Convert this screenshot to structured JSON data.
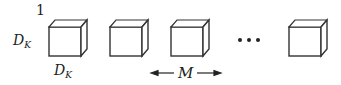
{
  "diagram": {
    "index_label": "1",
    "height_label": {
      "base": "D",
      "sub": "K"
    },
    "width_label": {
      "base": "D",
      "sub": "K"
    },
    "spacing_label": "M",
    "ellipsis": "···",
    "cubes": [
      {
        "id": "cube-1",
        "x": 49
      },
      {
        "id": "cube-2",
        "x": 110
      },
      {
        "id": "cube-3",
        "x": 171
      },
      {
        "id": "cube-last",
        "x": 289
      }
    ],
    "colors": {
      "stroke": "#333333",
      "fill": "#ffffff"
    }
  }
}
